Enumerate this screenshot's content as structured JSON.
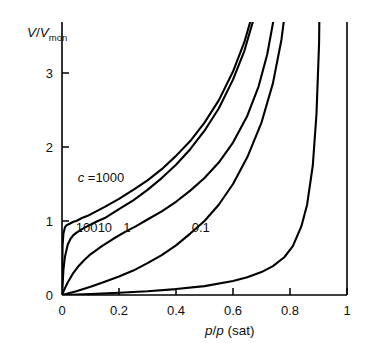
{
  "chart_data": {
    "type": "line",
    "title": "",
    "xlabel": "p/p (sat)",
    "ylabel": "V/Vmon",
    "ylabel_parts": {
      "numerator": "V",
      "denominator": "V",
      "denominator_sub": "mon"
    },
    "xlabel_parts": {
      "num": "p",
      "den": "p",
      "suffix": "(sat)"
    },
    "xlim": [
      0,
      1
    ],
    "ylim": [
      0,
      3.7
    ],
    "xticks": [
      0,
      0.2,
      0.4,
      0.6,
      0.8,
      1
    ],
    "xtick_labels": [
      "0",
      "0.2",
      "0.4",
      "0.6",
      "0.8",
      "1"
    ],
    "yticks": [
      0,
      1,
      2,
      3
    ],
    "ytick_labels": [
      "0",
      "1",
      "2",
      "3"
    ],
    "grid": false,
    "legend_position": "inline-annotations",
    "equation": "V/Vmon = c*z / ((1-z)*(1-z+c*z))",
    "series": [
      {
        "name": "c = 1000",
        "c": 1000,
        "label": "c =1000",
        "label_prefix_italic": "c",
        "label_rest": " =1000",
        "label_x": 0.055,
        "label_y": 1.53,
        "x": [
          0.0,
          0.002,
          0.005,
          0.01,
          0.015,
          0.02,
          0.03,
          0.04,
          0.05,
          0.07,
          0.09,
          0.12,
          0.15,
          0.2,
          0.25,
          0.3,
          0.35,
          0.4,
          0.45,
          0.5,
          0.55,
          0.6,
          0.64,
          0.68,
          0.7,
          0.72,
          0.74,
          0.75
        ],
        "y": [
          0.0,
          0.67,
          0.83,
          0.91,
          0.94,
          0.95,
          0.97,
          0.99,
          1.0,
          1.04,
          1.07,
          1.13,
          1.19,
          1.3,
          1.42,
          1.55,
          1.7,
          1.88,
          2.08,
          2.33,
          2.63,
          3.02,
          3.42,
          3.95,
          4.28,
          4.66,
          5.12,
          5.38
        ]
      },
      {
        "name": "c = 100",
        "c": 100,
        "label": "100",
        "label_x": 0.048,
        "label_y": 0.845,
        "x": [
          0.0,
          0.005,
          0.01,
          0.02,
          0.03,
          0.04,
          0.05,
          0.07,
          0.09,
          0.12,
          0.15,
          0.2,
          0.25,
          0.3,
          0.35,
          0.4,
          0.45,
          0.5,
          0.55,
          0.6,
          0.64,
          0.68,
          0.7,
          0.72,
          0.74,
          0.755
        ],
        "y": [
          0.0,
          0.34,
          0.51,
          0.68,
          0.76,
          0.81,
          0.84,
          0.89,
          0.93,
          0.99,
          1.04,
          1.16,
          1.28,
          1.42,
          1.58,
          1.76,
          1.97,
          2.22,
          2.52,
          2.91,
          3.3,
          3.83,
          4.16,
          4.55,
          5.01,
          5.4
        ]
      },
      {
        "name": "c = 10",
        "c": 10,
        "label": "10",
        "label_x": 0.125,
        "label_y": 0.845,
        "x": [
          0.0,
          0.01,
          0.02,
          0.04,
          0.06,
          0.08,
          0.1,
          0.14,
          0.18,
          0.22,
          0.26,
          0.3,
          0.35,
          0.4,
          0.45,
          0.5,
          0.55,
          0.6,
          0.65,
          0.69,
          0.72,
          0.75,
          0.77,
          0.785
        ],
        "y": [
          0.0,
          0.09,
          0.17,
          0.3,
          0.4,
          0.48,
          0.55,
          0.66,
          0.76,
          0.85,
          0.93,
          1.02,
          1.13,
          1.26,
          1.41,
          1.58,
          1.79,
          2.06,
          2.42,
          2.82,
          3.25,
          3.88,
          4.55,
          5.4
        ]
      },
      {
        "name": "c = 1",
        "c": 1,
        "label": "1",
        "label_x": 0.215,
        "label_y": 0.845,
        "x": [
          0.0,
          0.02,
          0.05,
          0.1,
          0.15,
          0.2,
          0.25,
          0.3,
          0.35,
          0.4,
          0.45,
          0.5,
          0.55,
          0.6,
          0.65,
          0.7,
          0.74,
          0.77,
          0.79,
          0.805,
          0.815
        ],
        "y": [
          0.0,
          0.02,
          0.05,
          0.11,
          0.18,
          0.25,
          0.33,
          0.43,
          0.54,
          0.67,
          0.83,
          1.0,
          1.22,
          1.5,
          1.86,
          2.33,
          2.86,
          3.45,
          4.05,
          4.75,
          5.4
        ]
      },
      {
        "name": "c = 0.1",
        "c": 0.1,
        "label": "0.1",
        "label_x": 0.455,
        "label_y": 0.845,
        "x": [
          0.0,
          0.05,
          0.1,
          0.2,
          0.3,
          0.4,
          0.5,
          0.6,
          0.65,
          0.7,
          0.74,
          0.78,
          0.81,
          0.84,
          0.86,
          0.88,
          0.893,
          0.902,
          0.908
        ],
        "y": [
          0.0,
          0.005,
          0.012,
          0.03,
          0.05,
          0.08,
          0.12,
          0.19,
          0.24,
          0.31,
          0.39,
          0.51,
          0.66,
          0.93,
          1.22,
          1.75,
          2.45,
          3.4,
          5.4
        ]
      }
    ]
  },
  "axes": {
    "y_axis_name": "V/Vmon axis",
    "x_axis_name": "p/p(sat) axis"
  }
}
